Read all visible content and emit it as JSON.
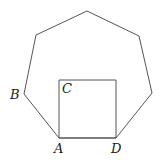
{
  "diagram": {
    "stroke_color": "#555555",
    "heptagon": {
      "points": [
        [
          87,
          11
        ],
        [
          139,
          36
        ],
        [
          152,
          93
        ],
        [
          116,
          138
        ],
        [
          59,
          138
        ],
        [
          24,
          94
        ],
        [
          36,
          35
        ]
      ]
    },
    "square": {
      "points": [
        [
          59,
          80
        ],
        [
          116,
          80
        ],
        [
          116,
          138
        ],
        [
          59,
          138
        ]
      ]
    },
    "labels": {
      "A": {
        "text": "A",
        "x": 54,
        "y": 153
      },
      "B": {
        "text": "B",
        "x": 10,
        "y": 99
      },
      "C": {
        "text": "C",
        "x": 62,
        "y": 93
      },
      "D": {
        "text": "D",
        "x": 111,
        "y": 153
      }
    }
  }
}
